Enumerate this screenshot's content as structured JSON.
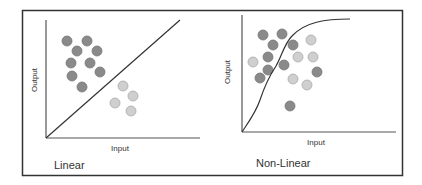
{
  "colors": {
    "dark": "#8a8a8a",
    "light": "#cfcfcf",
    "stroke": "#444444",
    "frame": "#333333"
  },
  "linear": {
    "title": "Linear",
    "xlabel": "Input",
    "ylabel": "Output",
    "dark_points": [
      [
        67,
        41
      ],
      [
        87,
        41
      ],
      [
        77,
        51
      ],
      [
        97,
        51
      ],
      [
        71,
        63
      ],
      [
        90,
        63
      ],
      [
        100,
        72
      ],
      [
        72,
        76
      ],
      [
        82,
        87
      ]
    ],
    "light_points": [
      [
        123,
        86
      ],
      [
        133,
        96
      ],
      [
        115,
        103
      ],
      [
        131,
        111
      ]
    ]
  },
  "nonlinear": {
    "title": "Non-Linear",
    "xlabel": "Input",
    "ylabel": "Output",
    "dark_points": [
      [
        263,
        35
      ],
      [
        282,
        34
      ],
      [
        273,
        45
      ],
      [
        293,
        45
      ],
      [
        268,
        57
      ],
      [
        284,
        65
      ],
      [
        268,
        70
      ],
      [
        260,
        78
      ],
      [
        317,
        72
      ],
      [
        290,
        106
      ]
    ],
    "light_points": [
      [
        311,
        40
      ],
      [
        253,
        62
      ],
      [
        298,
        57
      ],
      [
        313,
        57
      ],
      [
        293,
        79
      ],
      [
        307,
        85
      ]
    ]
  }
}
